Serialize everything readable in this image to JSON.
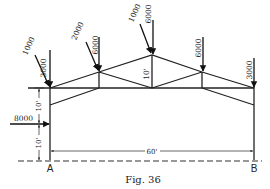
{
  "figure": {
    "caption": "Fig. 36",
    "type": "roof truss on columns with wind and vertical loads"
  },
  "loads": {
    "left_eave_inclined": "1000",
    "left_eave_vertical": "3000",
    "left_panel_inclined": "2000",
    "left_panel_vertical": "6000",
    "peak_inclined": "1000",
    "peak_vertical": "6000",
    "right_panel_vertical": "6000",
    "right_eave_vertical": "3000",
    "horizontal_column": "8000"
  },
  "dimensions": {
    "truss_rise": "10'",
    "upper_column_height": "10'",
    "lower_column_height": "10'",
    "span": "60'"
  },
  "supports": {
    "left": "A",
    "right": "B"
  }
}
